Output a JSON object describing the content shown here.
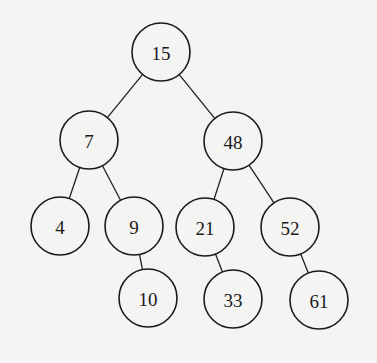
{
  "diagram": {
    "type": "binary-search-tree",
    "style": {
      "background": "#f4f4f2",
      "stroke": "#1a1a1a",
      "node_radius": 29
    },
    "nodes": [
      {
        "id": "n15",
        "label": "15",
        "x": 161,
        "y": 52
      },
      {
        "id": "n7",
        "label": "7",
        "x": 89,
        "y": 140
      },
      {
        "id": "n48",
        "label": "48",
        "x": 233,
        "y": 141
      },
      {
        "id": "n4",
        "label": "4",
        "x": 60,
        "y": 226
      },
      {
        "id": "n9",
        "label": "9",
        "x": 134,
        "y": 226
      },
      {
        "id": "n21",
        "label": "21",
        "x": 205,
        "y": 227
      },
      {
        "id": "n52",
        "label": "52",
        "x": 290,
        "y": 227
      },
      {
        "id": "n10",
        "label": "10",
        "x": 148,
        "y": 298
      },
      {
        "id": "n33",
        "label": "33",
        "x": 233,
        "y": 299
      },
      {
        "id": "n61",
        "label": "61",
        "x": 319,
        "y": 300
      }
    ],
    "edges": [
      {
        "from": "n15",
        "to": "n7"
      },
      {
        "from": "n15",
        "to": "n48"
      },
      {
        "from": "n7",
        "to": "n4"
      },
      {
        "from": "n7",
        "to": "n9"
      },
      {
        "from": "n48",
        "to": "n21"
      },
      {
        "from": "n48",
        "to": "n52"
      },
      {
        "from": "n9",
        "to": "n10"
      },
      {
        "from": "n21",
        "to": "n33"
      },
      {
        "from": "n52",
        "to": "n61"
      }
    ]
  }
}
